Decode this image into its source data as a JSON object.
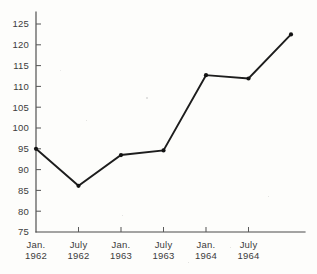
{
  "chart_data": {
    "type": "line",
    "title": "",
    "subtitle": "",
    "xlabel": "",
    "ylabel": "",
    "grid": false,
    "legend": "none",
    "ylim": [
      75,
      125
    ],
    "yticks": [
      75,
      80,
      85,
      90,
      95,
      100,
      105,
      110,
      115,
      120,
      125
    ],
    "ytick_labels": [
      "75",
      "80",
      "85",
      "90",
      "95",
      "100",
      "105",
      "110",
      "115",
      "120",
      "125"
    ],
    "categories": [
      "Jan. 1962",
      "July 1962",
      "Jan. 1963",
      "July 1963",
      "Jan. 1964",
      "July 1964",
      ""
    ],
    "xtick_labels": [
      {
        "month": "Jan.",
        "year": "1962"
      },
      {
        "month": "July",
        "year": "1962"
      },
      {
        "month": "Jan.",
        "year": "1963"
      },
      {
        "month": "July",
        "year": "1963"
      },
      {
        "month": "Jan.",
        "year": "1964"
      },
      {
        "month": "July",
        "year": "1964"
      }
    ],
    "values": [
      95.0,
      86.1,
      93.5,
      94.6,
      112.7,
      111.9,
      122.5
    ],
    "series": [
      {
        "name": "",
        "values": [
          95.0,
          86.1,
          93.5,
          94.6,
          112.7,
          111.9,
          122.5
        ],
        "color": "#131313",
        "marker": "circle"
      }
    ],
    "annotations": [],
    "axis_color": "#4a4a4a",
    "line_color": "#131313"
  },
  "geometry": {
    "y_top_value": 125,
    "y_top_px": 24,
    "y_bottom_value": 75,
    "y_bottom_px": 232,
    "x_origin_px": 36,
    "x_step_px": 42.5,
    "x_axis_end_px": 305,
    "axis_top_px": 12,
    "tick_len_y": 5,
    "tick_len_x": 5,
    "n_points": 7
  }
}
